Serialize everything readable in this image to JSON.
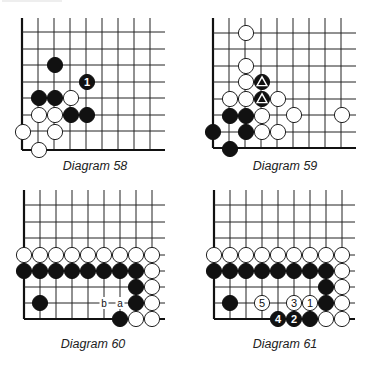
{
  "page": {
    "cut_off_header_text": ""
  },
  "diagrams": [
    {
      "id": "diagram-58",
      "caption": "Diagram 58",
      "caption_pos": [
        95,
        170
      ],
      "grid": {
        "x0": 22,
        "y0": 32,
        "dx": 16,
        "dy": 16.6,
        "cols": [
          22,
          38,
          54,
          70,
          86,
          102,
          118,
          134,
          150
        ],
        "rows": [
          32,
          49,
          65,
          82,
          98,
          115,
          131,
          150
        ],
        "right_extent": 165,
        "top_extent": 18,
        "left_edge": true,
        "bottom_edge": true
      },
      "stones": [
        {
          "color": "black",
          "x": 55,
          "y": 65,
          "label": ""
        },
        {
          "color": "black",
          "x": 87,
          "y": 82,
          "label": "1"
        },
        {
          "color": "black",
          "x": 39,
          "y": 98,
          "label": ""
        },
        {
          "color": "black",
          "x": 55,
          "y": 98,
          "label": ""
        },
        {
          "color": "white",
          "x": 71,
          "y": 98,
          "label": ""
        },
        {
          "color": "white",
          "x": 39,
          "y": 115,
          "label": ""
        },
        {
          "color": "white",
          "x": 55,
          "y": 115,
          "label": ""
        },
        {
          "color": "black",
          "x": 71,
          "y": 115,
          "label": ""
        },
        {
          "color": "black",
          "x": 87,
          "y": 115,
          "label": ""
        },
        {
          "color": "white",
          "x": 23,
          "y": 132,
          "label": ""
        },
        {
          "color": "white",
          "x": 55,
          "y": 132,
          "label": ""
        },
        {
          "color": "white",
          "x": 39,
          "y": 150,
          "label": ""
        }
      ],
      "point_labels": []
    },
    {
      "id": "diagram-59",
      "caption": "Diagram 59",
      "caption_pos": [
        285,
        170
      ],
      "grid": {
        "cols": [
          213,
          229,
          245,
          261,
          277,
          293,
          309,
          325,
          341
        ],
        "rows": [
          33,
          49,
          66,
          82,
          99,
          115,
          132,
          148
        ],
        "right_extent": 356,
        "top_extent": 18,
        "left_edge": true,
        "bottom_edge": true
      },
      "stones": [
        {
          "color": "white",
          "x": 246,
          "y": 33,
          "label": ""
        },
        {
          "color": "white",
          "x": 246,
          "y": 66,
          "label": ""
        },
        {
          "color": "white",
          "x": 246,
          "y": 82,
          "label": ""
        },
        {
          "color": "black",
          "x": 262,
          "y": 82,
          "label": "triangle"
        },
        {
          "color": "white",
          "x": 230,
          "y": 99,
          "label": ""
        },
        {
          "color": "white",
          "x": 246,
          "y": 99,
          "label": ""
        },
        {
          "color": "black",
          "x": 262,
          "y": 99,
          "label": "triangle"
        },
        {
          "color": "white",
          "x": 278,
          "y": 99,
          "label": ""
        },
        {
          "color": "black",
          "x": 230,
          "y": 116,
          "label": ""
        },
        {
          "color": "black",
          "x": 246,
          "y": 116,
          "label": ""
        },
        {
          "color": "white",
          "x": 262,
          "y": 116,
          "label": ""
        },
        {
          "color": "white",
          "x": 294,
          "y": 115,
          "label": ""
        },
        {
          "color": "white",
          "x": 342,
          "y": 115,
          "label": ""
        },
        {
          "color": "black",
          "x": 213,
          "y": 132,
          "label": ""
        },
        {
          "color": "black",
          "x": 246,
          "y": 132,
          "label": ""
        },
        {
          "color": "white",
          "x": 262,
          "y": 132,
          "label": ""
        },
        {
          "color": "white",
          "x": 278,
          "y": 132,
          "label": ""
        },
        {
          "color": "black",
          "x": 230,
          "y": 149,
          "label": ""
        }
      ],
      "point_labels": []
    },
    {
      "id": "diagram-60",
      "caption": "Diagram 60",
      "caption_pos": [
        93,
        348
      ],
      "grid": {
        "cols": [
          24,
          40,
          56,
          72,
          88,
          104,
          120,
          136,
          152
        ],
        "rows": [
          205,
          222,
          238,
          255,
          271,
          287,
          303,
          319
        ],
        "right_extent": 165,
        "top_extent": 190,
        "left_edge": true,
        "bottom_edge": true
      },
      "stones": [
        {
          "color": "white",
          "x": 24,
          "y": 255,
          "label": ""
        },
        {
          "color": "white",
          "x": 40,
          "y": 255,
          "label": ""
        },
        {
          "color": "white",
          "x": 56,
          "y": 255,
          "label": ""
        },
        {
          "color": "white",
          "x": 72,
          "y": 255,
          "label": ""
        },
        {
          "color": "white",
          "x": 88,
          "y": 255,
          "label": ""
        },
        {
          "color": "white",
          "x": 104,
          "y": 255,
          "label": ""
        },
        {
          "color": "white",
          "x": 120,
          "y": 255,
          "label": ""
        },
        {
          "color": "white",
          "x": 136,
          "y": 255,
          "label": ""
        },
        {
          "color": "white",
          "x": 152,
          "y": 255,
          "label": ""
        },
        {
          "color": "black",
          "x": 24,
          "y": 271,
          "label": ""
        },
        {
          "color": "black",
          "x": 40,
          "y": 271,
          "label": ""
        },
        {
          "color": "black",
          "x": 56,
          "y": 271,
          "label": ""
        },
        {
          "color": "black",
          "x": 72,
          "y": 271,
          "label": ""
        },
        {
          "color": "black",
          "x": 88,
          "y": 271,
          "label": ""
        },
        {
          "color": "black",
          "x": 104,
          "y": 271,
          "label": ""
        },
        {
          "color": "black",
          "x": 120,
          "y": 271,
          "label": ""
        },
        {
          "color": "black",
          "x": 136,
          "y": 271,
          "label": ""
        },
        {
          "color": "white",
          "x": 152,
          "y": 271,
          "label": ""
        },
        {
          "color": "black",
          "x": 136,
          "y": 287,
          "label": ""
        },
        {
          "color": "white",
          "x": 152,
          "y": 287,
          "label": ""
        },
        {
          "color": "black",
          "x": 40,
          "y": 303,
          "label": ""
        },
        {
          "color": "black",
          "x": 136,
          "y": 303,
          "label": ""
        },
        {
          "color": "white",
          "x": 152,
          "y": 303,
          "label": ""
        },
        {
          "color": "black",
          "x": 120,
          "y": 319,
          "label": ""
        },
        {
          "color": "white",
          "x": 136,
          "y": 319,
          "label": ""
        },
        {
          "color": "white",
          "x": 152,
          "y": 319,
          "label": ""
        }
      ],
      "point_labels": [
        {
          "text": "b",
          "x": 104,
          "y": 303
        },
        {
          "text": "a",
          "x": 120,
          "y": 303
        }
      ]
    },
    {
      "id": "diagram-61",
      "caption": "Diagram 61",
      "caption_pos": [
        285,
        348
      ],
      "grid": {
        "cols": [
          214,
          230,
          246,
          262,
          278,
          294,
          310,
          326,
          342
        ],
        "rows": [
          205,
          222,
          238,
          255,
          271,
          287,
          303,
          319
        ],
        "right_extent": 355,
        "top_extent": 190,
        "left_edge": true,
        "bottom_edge": true
      },
      "stones": [
        {
          "color": "white",
          "x": 214,
          "y": 255,
          "label": ""
        },
        {
          "color": "white",
          "x": 230,
          "y": 255,
          "label": ""
        },
        {
          "color": "white",
          "x": 246,
          "y": 255,
          "label": ""
        },
        {
          "color": "white",
          "x": 262,
          "y": 255,
          "label": ""
        },
        {
          "color": "white",
          "x": 278,
          "y": 255,
          "label": ""
        },
        {
          "color": "white",
          "x": 294,
          "y": 255,
          "label": ""
        },
        {
          "color": "white",
          "x": 310,
          "y": 255,
          "label": ""
        },
        {
          "color": "white",
          "x": 326,
          "y": 255,
          "label": ""
        },
        {
          "color": "white",
          "x": 342,
          "y": 255,
          "label": ""
        },
        {
          "color": "black",
          "x": 214,
          "y": 271,
          "label": ""
        },
        {
          "color": "black",
          "x": 230,
          "y": 271,
          "label": ""
        },
        {
          "color": "black",
          "x": 246,
          "y": 271,
          "label": ""
        },
        {
          "color": "black",
          "x": 262,
          "y": 271,
          "label": ""
        },
        {
          "color": "black",
          "x": 278,
          "y": 271,
          "label": ""
        },
        {
          "color": "black",
          "x": 294,
          "y": 271,
          "label": ""
        },
        {
          "color": "black",
          "x": 310,
          "y": 271,
          "label": ""
        },
        {
          "color": "black",
          "x": 326,
          "y": 271,
          "label": ""
        },
        {
          "color": "white",
          "x": 342,
          "y": 271,
          "label": ""
        },
        {
          "color": "black",
          "x": 326,
          "y": 287,
          "label": ""
        },
        {
          "color": "white",
          "x": 342,
          "y": 287,
          "label": ""
        },
        {
          "color": "black",
          "x": 230,
          "y": 303,
          "label": ""
        },
        {
          "color": "white",
          "x": 262,
          "y": 303,
          "label": "5"
        },
        {
          "color": "white",
          "x": 294,
          "y": 303,
          "label": "3"
        },
        {
          "color": "white",
          "x": 310,
          "y": 303,
          "label": "1"
        },
        {
          "color": "black",
          "x": 326,
          "y": 303,
          "label": ""
        },
        {
          "color": "white",
          "x": 342,
          "y": 303,
          "label": ""
        },
        {
          "color": "black",
          "x": 278,
          "y": 319,
          "label": "4"
        },
        {
          "color": "black",
          "x": 294,
          "y": 319,
          "label": "2"
        },
        {
          "color": "black",
          "x": 310,
          "y": 319,
          "label": ""
        },
        {
          "color": "white",
          "x": 326,
          "y": 319,
          "label": ""
        },
        {
          "color": "white",
          "x": 342,
          "y": 319,
          "label": ""
        }
      ],
      "point_labels": []
    }
  ],
  "style": {
    "stone_radius": 7.6,
    "black": "#111111",
    "white": "#ffffff",
    "line": "#222222"
  }
}
